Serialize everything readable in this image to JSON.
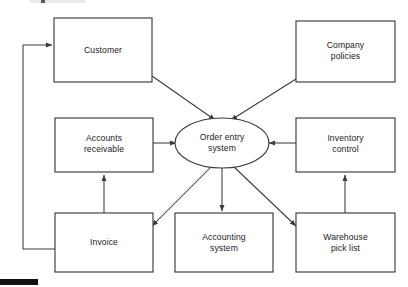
{
  "diagram": {
    "type": "flowchart",
    "background_color": "#ffffff",
    "stroke_color": "#3b3b3b",
    "text_color": "#1a1a1a",
    "nodes": [
      {
        "id": "customer",
        "shape": "rectangle",
        "label": "Customer",
        "lines": [
          "Customer"
        ],
        "x": 54,
        "y": 18,
        "w": 98,
        "h": 64
      },
      {
        "id": "company-policies",
        "shape": "rectangle",
        "label": "Company policies",
        "lines": [
          "Company",
          "policies"
        ],
        "x": 296,
        "y": 21,
        "w": 99,
        "h": 61
      },
      {
        "id": "accounts-receivable",
        "shape": "rectangle",
        "label": "Accounts receivable",
        "lines": [
          "Accounts",
          "receivable"
        ],
        "x": 55,
        "y": 118,
        "w": 98,
        "h": 54
      },
      {
        "id": "order-entry-system",
        "shape": "ellipse",
        "label": "Order entry system",
        "lines": [
          "Order entry",
          "system"
        ],
        "cx": 222,
        "cy": 143,
        "rx": 47,
        "ry": 25
      },
      {
        "id": "inventory-control",
        "shape": "rectangle",
        "label": "Inventory control",
        "lines": [
          "Inventory",
          "control"
        ],
        "x": 296,
        "y": 118,
        "w": 99,
        "h": 54
      },
      {
        "id": "invoice",
        "shape": "rectangle",
        "label": "Invoice",
        "lines": [
          "Invoice"
        ],
        "x": 55,
        "y": 213,
        "w": 98,
        "h": 59
      },
      {
        "id": "accounting-system",
        "shape": "rectangle",
        "label": "Accounting system",
        "lines": [
          "Accounting",
          "system"
        ],
        "x": 175,
        "y": 213,
        "w": 98,
        "h": 59
      },
      {
        "id": "warehouse-pick-list",
        "shape": "rectangle",
        "label": "Warehouse pick list",
        "lines": [
          "Warehouse",
          "pick list"
        ],
        "x": 296,
        "y": 213,
        "w": 99,
        "h": 59
      }
    ],
    "edges": [
      {
        "id": "customer-to-order-entry",
        "from": "customer",
        "to": "order-entry-system",
        "style": "straight",
        "arrow": "end"
      },
      {
        "id": "company-policies-to-order-entry",
        "from": "company-policies",
        "to": "order-entry-system",
        "style": "straight",
        "arrow": "end"
      },
      {
        "id": "accounts-receivable-to-order-entry",
        "from": "accounts-receivable",
        "to": "order-entry-system",
        "style": "straight",
        "arrow": "end"
      },
      {
        "id": "inventory-control-to-order-entry",
        "from": "inventory-control",
        "to": "order-entry-system",
        "style": "straight",
        "arrow": "end"
      },
      {
        "id": "order-entry-to-invoice",
        "from": "order-entry-system",
        "to": "invoice",
        "style": "straight",
        "arrow": "end"
      },
      {
        "id": "order-entry-to-accounting-system",
        "from": "order-entry-system",
        "to": "accounting-system",
        "style": "straight",
        "arrow": "end"
      },
      {
        "id": "order-entry-to-warehouse-pick-list",
        "from": "order-entry-system",
        "to": "warehouse-pick-list",
        "style": "straight",
        "arrow": "end"
      },
      {
        "id": "invoice-to-accounts-receivable",
        "from": "invoice",
        "to": "accounts-receivable",
        "style": "straight",
        "arrow": "end"
      },
      {
        "id": "warehouse-pick-list-to-inventory-control",
        "from": "warehouse-pick-list",
        "to": "inventory-control",
        "style": "straight",
        "arrow": "end"
      },
      {
        "id": "invoice-to-customer",
        "from": "invoice",
        "to": "customer",
        "style": "orthogonal-left-loop",
        "arrow": "end"
      }
    ]
  }
}
